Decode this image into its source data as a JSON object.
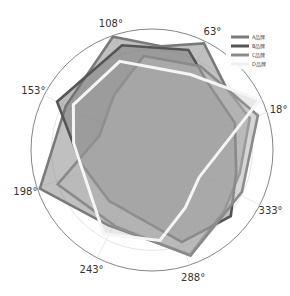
{
  "chart_data": {
    "type": "radar",
    "title": "",
    "angular_ticks": [
      "18°",
      "63°",
      "108°",
      "153°",
      "198°",
      "243°",
      "288°",
      "333°"
    ],
    "angular_tick_degrees": [
      18,
      63,
      108,
      153,
      198,
      243,
      288,
      333
    ],
    "radial_range": [
      0,
      1
    ],
    "radial_grid": [
      0.83,
      1.0
    ],
    "grid": true,
    "legend_position": "top-right",
    "series": [
      {
        "name": "A品牌",
        "color": "#7a7a7a",
        "fill": "#8c8c8c",
        "fill_opacity": 0.55,
        "points": [
          [
            18,
            0.85
          ],
          [
            40,
            0.8
          ],
          [
            64,
            0.98
          ],
          [
            85,
            0.86
          ],
          [
            109,
            0.99
          ],
          [
            153,
            0.8
          ],
          [
            199,
            0.98
          ],
          [
            240,
            0.72
          ],
          [
            290,
            0.92
          ],
          [
            320,
            0.78
          ],
          [
            345,
            0.75
          ]
        ]
      },
      {
        "name": "B品牌",
        "color": "#555555",
        "fill": "#6e6e6e",
        "fill_opacity": 0.45,
        "points": [
          [
            18,
            0.72
          ],
          [
            50,
            0.72
          ],
          [
            70,
            0.88
          ],
          [
            106,
            0.9
          ],
          [
            153,
            0.88
          ],
          [
            190,
            0.6
          ],
          [
            230,
            0.55
          ],
          [
            288,
            0.8
          ],
          [
            320,
            0.85
          ],
          [
            345,
            0.72
          ]
        ]
      },
      {
        "name": "C品牌",
        "color": "#8a8a8a",
        "fill": "#b4b4b4",
        "fill_opacity": 0.55,
        "points": [
          [
            18,
            0.92
          ],
          [
            60,
            0.8
          ],
          [
            95,
            0.78
          ],
          [
            125,
            0.55
          ],
          [
            165,
            0.45
          ],
          [
            200,
            0.83
          ],
          [
            245,
            0.7
          ],
          [
            290,
            0.93
          ],
          [
            335,
            0.82
          ]
        ]
      },
      {
        "name": "D品牌",
        "color": "#f5f5f5",
        "fill": "#a0a0a0",
        "fill_opacity": 0.25,
        "points": [
          [
            25,
            0.98
          ],
          [
            63,
            0.7
          ],
          [
            110,
            0.78
          ],
          [
            150,
            0.75
          ],
          [
            175,
            0.65
          ],
          [
            240,
            0.8
          ],
          [
            275,
            0.75
          ],
          [
            300,
            0.55
          ],
          [
            330,
            0.45
          ]
        ]
      }
    ]
  }
}
